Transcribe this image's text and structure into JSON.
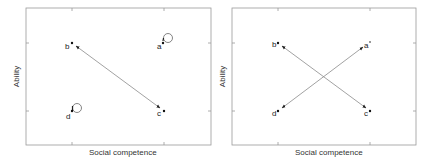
{
  "panels": [
    {
      "id": "left",
      "xlabel": "Social competence",
      "ylabel": "Ability",
      "points": [
        {
          "label": "a",
          "x": 163,
          "y": 43,
          "self_loop": true
        },
        {
          "label": "b",
          "x": 72,
          "y": 43,
          "self_loop": false
        },
        {
          "label": "c",
          "x": 164,
          "y": 111,
          "self_loop": false
        },
        {
          "label": "d",
          "x": 72,
          "y": 111,
          "self_loop": true
        }
      ],
      "edges": [
        {
          "from": "b",
          "to": "c",
          "type": "bidirectional"
        }
      ]
    },
    {
      "id": "right",
      "xlabel": "Social competence",
      "ylabel": "Ability",
      "points": [
        {
          "label": "a",
          "x": 370,
          "y": 43,
          "self_loop": false
        },
        {
          "label": "b",
          "x": 278,
          "y": 43,
          "self_loop": false
        },
        {
          "label": "c",
          "x": 370,
          "y": 111,
          "self_loop": false
        },
        {
          "label": "d",
          "x": 278,
          "y": 111,
          "self_loop": false
        }
      ],
      "edges": [
        {
          "from": "b",
          "to": "c",
          "type": "bidirectional"
        },
        {
          "from": "d",
          "to": "a",
          "type": "bidirectional"
        }
      ]
    }
  ],
  "colors": {
    "frame": "#9a9a9a",
    "arrow": "#8a8a8a",
    "point": "#111111"
  }
}
